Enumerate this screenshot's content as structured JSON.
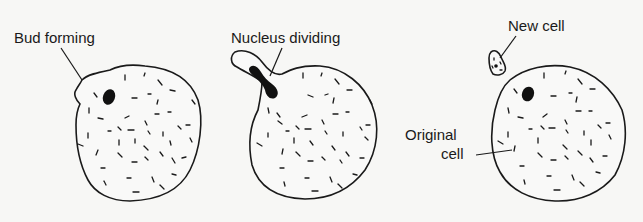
{
  "stages": [
    {
      "id": "bud-forming",
      "label": "Bud forming"
    },
    {
      "id": "nucleus-dividing",
      "label": "Nucleus dividing"
    },
    {
      "id": "separated",
      "labels": {
        "new_cell": "New cell",
        "original_cell_line1": "Original",
        "original_cell_line2": "cell"
      }
    }
  ],
  "colors": {
    "background": "#f7f7f5",
    "ink": "#1a1a1a"
  }
}
